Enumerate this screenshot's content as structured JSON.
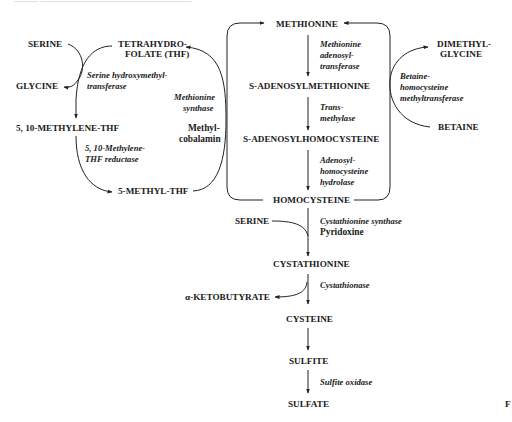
{
  "header": {
    "text": "———  ———————————————————"
  },
  "corner_label": "F",
  "metabolites": {
    "serine_left": "SERINE",
    "thf_line1": "TETRAHYDRO-",
    "thf_line2": "FOLATE (THF)",
    "glycine": "GLYCINE",
    "methylene_thf": "5, 10-METHYLENE-THF",
    "methyl_thf": "5-METHYL-THF",
    "methionine": "METHIONINE",
    "sam": "S-ADENOSYLMETHIONINE",
    "sah": "S-ADENOSYLHOMOCYSTEINE",
    "homocysteine": "HOMOCYSTEINE",
    "dimethylglycine_line1": "DIMETHYL-",
    "dimethylglycine_line2": "GLYCINE",
    "betaine": "BETAINE",
    "serine_mid": "SERINE",
    "cystathionine": "CYSTATHIONINE",
    "ketobutyrate": "α-KETOBUTYRATE",
    "cysteine": "CYSTEINE",
    "sulfite": "SULFITE",
    "sulfate": "SULFATE"
  },
  "enzymes": {
    "shmt_line1": "Serine hydroxymethyl-",
    "shmt_line2": "transferase",
    "mthfr_line1": "5, 10-Methylene-",
    "mthfr_line2": "THF reductase",
    "ms_line1": "Methionine",
    "ms_line2": "synthase",
    "mat_line1": "Methionine",
    "mat_line2": "adenosyl-",
    "mat_line3": "transferase",
    "mt_line1": "Trans-",
    "mt_line2": "methylase",
    "sahh_line1": "Adenosyl-",
    "sahh_line2": "homocysteine",
    "sahh_line3": "hydrolase",
    "bhmt_line1": "Betaine-",
    "bhmt_line2": "homocysteine",
    "bhmt_line3": "methyltransferase",
    "cbs": "Cystathionine synthase",
    "cgl": "Cystathionase",
    "so": "Sulfite oxidase"
  },
  "cofactors": {
    "methylcobalamin_line1": "Methyl-",
    "methylcobalamin_line2": "cobalamin",
    "pyridoxine": "Pyridoxine"
  }
}
